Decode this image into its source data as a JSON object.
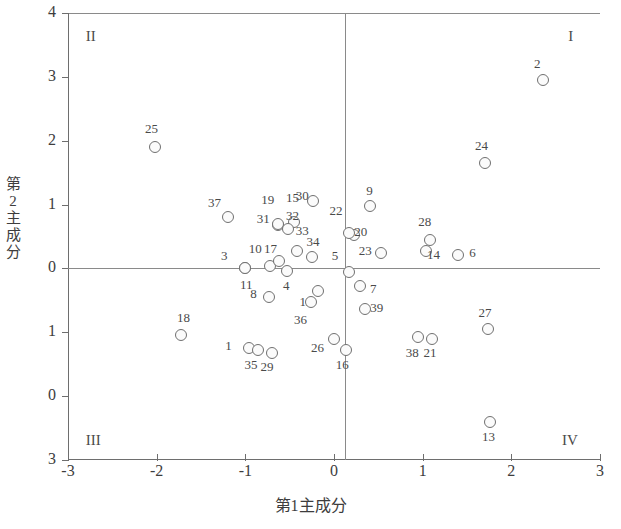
{
  "chart_data": {
    "type": "scatter",
    "title": "",
    "xlabel": "第1主成分",
    "ylabel": "第2主成分",
    "xlim": [
      -3,
      3
    ],
    "ylim": [
      -3,
      4
    ],
    "xticks": [
      "-3",
      "-2",
      "-1",
      "0",
      "1",
      "2",
      "3"
    ],
    "xtick_values": [
      -3,
      -2,
      -1,
      0,
      1,
      2,
      3
    ],
    "yticks": [
      "4",
      "3",
      "2",
      "1",
      "0",
      "1",
      "0",
      "3"
    ],
    "ytick_values": [
      4,
      3,
      2,
      1,
      0,
      -1,
      -2,
      -3
    ],
    "grid": false,
    "legend": null,
    "quadrant_labels": [
      {
        "name": "I",
        "text": "I",
        "x": 2.72,
        "y": 3.62
      },
      {
        "name": "II",
        "text": "II",
        "x": -2.72,
        "y": 3.62
      },
      {
        "name": "III",
        "text": "III",
        "x": -2.72,
        "y": -2.7
      },
      {
        "name": "IV",
        "text": "IV",
        "x": 2.65,
        "y": -2.7
      }
    ],
    "points": [
      {
        "label": "1",
        "x": -0.96,
        "y": -1.25,
        "lx": -1.18,
        "ly": -1.22
      },
      {
        "label": "2",
        "x": 2.36,
        "y": 2.95,
        "lx": 2.3,
        "ly": 3.2
      },
      {
        "label": "3",
        "x": -1.0,
        "y": 0.0,
        "lx": -1.23,
        "ly": 0.2
      },
      {
        "label": "4",
        "x": -0.53,
        "y": -0.04,
        "lx": -0.53,
        "ly": -0.28
      },
      {
        "label": "5",
        "x": 0.17,
        "y": -0.06,
        "lx": 0.02,
        "ly": 0.19
      },
      {
        "label": "6",
        "x": 1.4,
        "y": 0.21,
        "lx": 1.57,
        "ly": 0.24
      },
      {
        "label": "7",
        "x": 0.29,
        "y": -0.28,
        "lx": 0.45,
        "ly": -0.32
      },
      {
        "label": "8",
        "x": -0.73,
        "y": -0.45,
        "lx": -0.9,
        "ly": -0.4
      },
      {
        "label": "9",
        "x": 0.41,
        "y": 0.98,
        "lx": 0.41,
        "ly": 1.22
      },
      {
        "label": "10",
        "x": -0.72,
        "y": 0.04,
        "lx": -0.87,
        "ly": 0.31
      },
      {
        "label": "11",
        "x": -1.0,
        "y": 0.0,
        "lx": -0.97,
        "ly": -0.26
      },
      {
        "label": "12",
        "x": -0.18,
        "y": -0.35,
        "lx": -0.3,
        "ly": -0.52
      },
      {
        "label": "13",
        "x": 1.76,
        "y": -2.4,
        "lx": 1.76,
        "ly": -2.64
      },
      {
        "label": "14",
        "x": 1.04,
        "y": 0.28,
        "lx": 1.14,
        "ly": 0.21
      },
      {
        "label": "15",
        "x": -0.45,
        "y": 0.72,
        "lx": -0.45,
        "ly": 1.1
      },
      {
        "label": "16",
        "x": 0.13,
        "y": -1.28,
        "lx": 0.11,
        "ly": -1.52
      },
      {
        "label": "17",
        "x": -0.62,
        "y": 0.12,
        "lx": -0.7,
        "ly": 0.3
      },
      {
        "label": "18",
        "x": -1.72,
        "y": -1.05,
        "lx": -1.68,
        "ly": -0.78
      },
      {
        "label": "19",
        "x": -0.63,
        "y": 0.68,
        "lx": -0.73,
        "ly": 1.07
      },
      {
        "label": "20",
        "x": 0.23,
        "y": 0.52,
        "lx": 0.32,
        "ly": 0.57
      },
      {
        "label": "21",
        "x": 1.11,
        "y": -1.1,
        "lx": 1.1,
        "ly": -1.33
      },
      {
        "label": "22",
        "x": 0.17,
        "y": 0.55,
        "lx": 0.04,
        "ly": 0.9
      },
      {
        "label": "23",
        "x": 0.53,
        "y": 0.24,
        "lx": 0.37,
        "ly": 0.28
      },
      {
        "label": "24",
        "x": 1.7,
        "y": 1.65,
        "lx": 1.68,
        "ly": 1.92
      },
      {
        "label": "25",
        "x": -2.02,
        "y": 1.9,
        "lx": -2.04,
        "ly": 2.18
      },
      {
        "label": "26",
        "x": 0.0,
        "y": -1.11,
        "lx": -0.17,
        "ly": -1.24
      },
      {
        "label": "27",
        "x": 1.74,
        "y": -0.95,
        "lx": 1.72,
        "ly": -0.7
      },
      {
        "label": "28",
        "x": 1.08,
        "y": 0.45,
        "lx": 1.04,
        "ly": 0.73
      },
      {
        "label": "29",
        "x": -0.7,
        "y": -1.32,
        "lx": -0.74,
        "ly": -1.55
      },
      {
        "label": "30",
        "x": -0.24,
        "y": 1.06,
        "lx": -0.34,
        "ly": 1.13
      },
      {
        "label": "31",
        "x": -0.63,
        "y": 0.7,
        "lx": -0.78,
        "ly": 0.78
      },
      {
        "label": "32",
        "x": -0.52,
        "y": 0.62,
        "lx": -0.45,
        "ly": 0.82
      },
      {
        "label": "33",
        "x": -0.42,
        "y": 0.28,
        "lx": -0.34,
        "ly": 0.58
      },
      {
        "label": "34",
        "x": -0.25,
        "y": 0.18,
        "lx": -0.22,
        "ly": 0.42
      },
      {
        "label": "35",
        "x": -0.86,
        "y": -1.28,
        "lx": -0.92,
        "ly": -1.52
      },
      {
        "label": "36",
        "x": -0.26,
        "y": -0.52,
        "lx": -0.36,
        "ly": -0.8
      },
      {
        "label": "37",
        "x": -1.2,
        "y": 0.8,
        "lx": -1.33,
        "ly": 1.02
      },
      {
        "label": "38",
        "x": 0.95,
        "y": -1.08,
        "lx": 0.9,
        "ly": -1.33
      },
      {
        "label": "39",
        "x": 0.35,
        "y": -0.64,
        "lx": 0.5,
        "ly": -0.62
      }
    ]
  }
}
